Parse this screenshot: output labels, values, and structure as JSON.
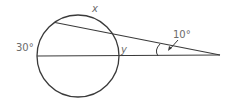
{
  "diagram": {
    "type": "geometry-secant-circle",
    "stroke_color": "#3a3a3a",
    "label_color": "#6b6b6b",
    "circle": {
      "cx": 78,
      "cy": 56,
      "r": 41
    },
    "horizontal_secant": {
      "x1": 37,
      "y1": 56,
      "x2": 220,
      "y2": 55
    },
    "upper_secant": {
      "x1": 55,
      "y1": 22.5,
      "x2": 220,
      "y2": 55
    },
    "labels": {
      "arc_top": "x",
      "arc_left": "30°",
      "arc_inner": "y",
      "angle": "10°"
    }
  }
}
